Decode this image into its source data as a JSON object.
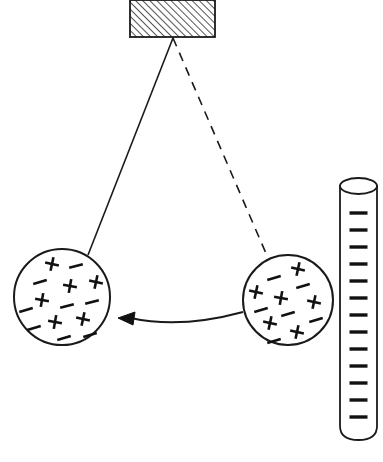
{
  "diagram": {
    "background_color": "#ffffff",
    "line_color": "#1a1a1a",
    "canvas": {
      "width": 383,
      "height": 462
    },
    "support_block": {
      "label": "ceiling-support-block",
      "x": 130,
      "y": 0,
      "width": 85,
      "height": 37,
      "hatch_angle_deg": 45,
      "hatch_spacing": 5,
      "fill": "#ffffff",
      "stroke": "#1a1a1a"
    },
    "pivot": {
      "label": "pivot-point",
      "x": 173,
      "y": 38
    },
    "strings": [
      {
        "name": "string-displaced-position",
        "style": "solid",
        "x1": 173,
        "y1": 38,
        "x2": 88,
        "y2": 255,
        "stroke_width": 1.6
      },
      {
        "name": "string-rest-position",
        "style": "dashed",
        "dash_pattern": "9,7",
        "x1": 173,
        "y1": 38,
        "x2": 268,
        "y2": 258,
        "stroke_width": 1.6
      }
    ],
    "spheres": [
      {
        "name": "sphere-displaced-left",
        "cx": 62,
        "cy": 297,
        "r": 48,
        "stroke_width": 2,
        "fill": "#ffffff",
        "charges": [
          {
            "type": "plus",
            "x": -10,
            "y": -33,
            "angle": 12
          },
          {
            "type": "minus",
            "x": 14,
            "y": -31,
            "angle": -14
          },
          {
            "type": "minus",
            "x": -22,
            "y": -15,
            "angle": -16
          },
          {
            "type": "plus",
            "x": 8,
            "y": -11,
            "angle": 10
          },
          {
            "type": "plus",
            "x": 34,
            "y": -15,
            "angle": 12
          },
          {
            "type": "plus",
            "x": -20,
            "y": 3,
            "angle": 10
          },
          {
            "type": "minus",
            "x": 5,
            "y": 9,
            "angle": -14
          },
          {
            "type": "minus",
            "x": 30,
            "y": 5,
            "angle": -14
          },
          {
            "type": "minus",
            "x": -36,
            "y": 13,
            "angle": -16
          },
          {
            "type": "plus",
            "x": -7,
            "y": 25,
            "angle": 10
          },
          {
            "type": "plus",
            "x": 21,
            "y": 22,
            "angle": 12
          },
          {
            "type": "minus",
            "x": -28,
            "y": 31,
            "angle": -16
          },
          {
            "type": "minus",
            "x": 2,
            "y": 41,
            "angle": -16
          },
          {
            "type": "minus",
            "x": 28,
            "y": 38,
            "angle": -16
          }
        ]
      },
      {
        "name": "sphere-rest-right",
        "cx": 288,
        "cy": 300,
        "r": 45,
        "stroke_width": 2,
        "fill": "#ffffff",
        "charges": [
          {
            "type": "plus",
            "x": 10,
            "y": -31,
            "angle": 12
          },
          {
            "type": "minus",
            "x": -14,
            "y": -22,
            "angle": -16
          },
          {
            "type": "plus",
            "x": -32,
            "y": -8,
            "angle": 12
          },
          {
            "type": "minus",
            "x": 15,
            "y": -14,
            "angle": -16
          },
          {
            "type": "plus",
            "x": -7,
            "y": -2,
            "angle": 10
          },
          {
            "type": "minus",
            "x": -27,
            "y": 10,
            "angle": -16
          },
          {
            "type": "plus",
            "x": 26,
            "y": 2,
            "angle": 12
          },
          {
            "type": "minus",
            "x": 0,
            "y": 14,
            "angle": -16
          },
          {
            "type": "plus",
            "x": -18,
            "y": 23,
            "angle": 12
          },
          {
            "type": "minus",
            "x": 28,
            "y": 20,
            "angle": -16
          },
          {
            "type": "plus",
            "x": 9,
            "y": 32,
            "angle": 12
          },
          {
            "type": "minus",
            "x": -14,
            "y": 41,
            "angle": -16
          }
        ]
      }
    ],
    "force_arrow": {
      "name": "attraction-force-arrow",
      "direction": "left",
      "tail_x": 243,
      "tail_y": 312,
      "head_x": 118,
      "head_y": 318,
      "curve_control_x": 180,
      "curve_control_y": 329,
      "stroke_width": 2
    },
    "charged_rod": {
      "name": "negatively-charged-rod",
      "x": 340,
      "y_top": 186,
      "width": 37,
      "y_bottom": 440,
      "ellipse_ry": 8,
      "bottom_radius": 14,
      "stroke_width": 1.8,
      "fill": "#ffffff",
      "charge_type": "minus",
      "charge_count": 13,
      "charge_first_y": 213,
      "charge_spacing": 17,
      "charge_width": 18
    }
  }
}
